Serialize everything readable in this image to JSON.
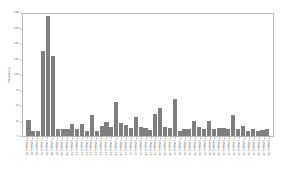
{
  "chart_data": {
    "type": "bar",
    "title": "",
    "xlabel": "",
    "ylabel": "Frequency",
    "ylim": [
      0,
      200
    ],
    "ytick_values": [
      0,
      25,
      50,
      75,
      100,
      125,
      150,
      175,
      200
    ],
    "ytick_labels": [
      "0",
      "25",
      "50",
      "75",
      "100",
      "125",
      "150",
      "175",
      "200"
    ],
    "grid": false,
    "legend": false,
    "bar_color": "#7f7f7f",
    "frame_color": "#b9b9b9",
    "background_color": "#ffffff",
    "categories": [
      "category 01",
      "category 02",
      "category 03",
      "category 04",
      "category 05",
      "category 06",
      "category 07",
      "category 08",
      "category 09",
      "category 10",
      "category 11",
      "category 12",
      "category 13",
      "category 14",
      "category 15",
      "category 16",
      "category 17",
      "category 18",
      "category 19",
      "category 20",
      "category 21",
      "category 22",
      "category 23",
      "category 24",
      "category 25",
      "category 26",
      "category 27",
      "category 28",
      "category 29",
      "category 30",
      "category 31",
      "category 32",
      "category 33",
      "category 34",
      "category 35",
      "category 36",
      "category 37",
      "category 38",
      "category 39",
      "category 40",
      "category 41",
      "category 42",
      "category 43",
      "category 44",
      "category 45",
      "category 46",
      "category 47",
      "category 48",
      "category 49",
      "category 50"
    ],
    "values": [
      26,
      9,
      9,
      139,
      197,
      131,
      11,
      12,
      12,
      20,
      11,
      20,
      9,
      34,
      9,
      17,
      23,
      14,
      56,
      22,
      18,
      13,
      31,
      14,
      13,
      10,
      36,
      46,
      15,
      13,
      61,
      9,
      11,
      12,
      25,
      14,
      12,
      24,
      12,
      13,
      13,
      12,
      34,
      11,
      16,
      9,
      11,
      9,
      10,
      12
    ]
  }
}
